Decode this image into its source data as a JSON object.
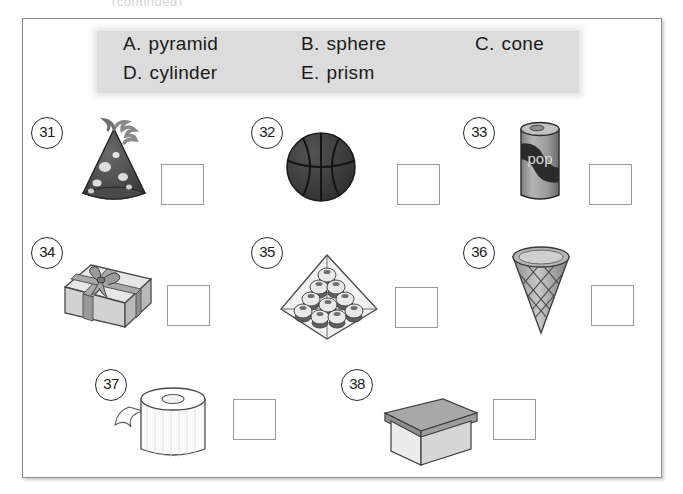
{
  "header": {
    "clipped_text": "(continued)"
  },
  "worksheet": {
    "answer_bank": {
      "options": [
        {
          "letter": "A.",
          "label": "pyramid"
        },
        {
          "letter": "B.",
          "label": "sphere"
        },
        {
          "letter": "C.",
          "label": "cone"
        },
        {
          "letter": "D.",
          "label": "cylinder"
        },
        {
          "letter": "E.",
          "label": "prism"
        }
      ],
      "background_color": "#dcdcdc"
    },
    "items": [
      {
        "number": "31",
        "figure": "party-hat",
        "answer_value": ""
      },
      {
        "number": "32",
        "figure": "basketball",
        "answer_value": ""
      },
      {
        "number": "33",
        "figure": "soda-can",
        "can_label": "pop",
        "answer_value": ""
      },
      {
        "number": "34",
        "figure": "gift-box",
        "answer_value": ""
      },
      {
        "number": "35",
        "figure": "stacked-cupcake-pyramid",
        "answer_value": ""
      },
      {
        "number": "36",
        "figure": "waffle-cone",
        "answer_value": ""
      },
      {
        "number": "37",
        "figure": "paper-towel-roll",
        "answer_value": ""
      },
      {
        "number": "38",
        "figure": "storage-box-with-lid",
        "answer_value": ""
      }
    ],
    "colors": {
      "page_background": "#ffffff",
      "page_border": "#8c8c8c",
      "answer_box_border": "#9a9a9a",
      "ink": "#1a1a1a"
    }
  }
}
